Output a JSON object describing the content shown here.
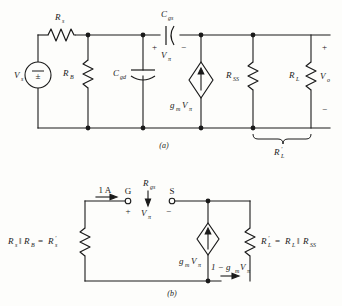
{
  "figure": {
    "caption_a": "(a)",
    "caption_b": "(b)"
  },
  "circuit_a": {
    "source_label": "V",
    "source_sub": "s",
    "source_symbol": "±",
    "rs_label": "R",
    "rs_sub": "s",
    "rb_label": "R",
    "rb_sub": "B",
    "cgd_label": "C",
    "cgd_sub": "gd",
    "cgs_label": "C",
    "cgs_sub": "gs",
    "vpi_label": "V",
    "vpi_sub": "π",
    "vpi_plus": "+",
    "vpi_minus": "−",
    "dep_source_gm": "g",
    "dep_source_gm_sub": "m",
    "dep_source_v": "V",
    "dep_source_v_sub": "π",
    "rss_label": "R",
    "rss_sub": "SS",
    "rl_label": "R",
    "rl_sub": "L",
    "vo_label": "V",
    "vo_sub": "o",
    "vo_plus": "+",
    "vo_minus": "−",
    "brace_label": "R",
    "brace_prime": "′",
    "brace_sub": "L"
  },
  "circuit_b": {
    "current_value": "1 A",
    "terminal_g": "G",
    "terminal_s": "S",
    "rgs_label": "R",
    "rgs_sub": "gs",
    "vpi_label": "V",
    "vpi_sub": "π",
    "vpi_plus": "+",
    "vpi_minus": "−",
    "left_res_expr": "R",
    "left_res_sub1": "s",
    "left_res_par": "‖",
    "left_res_expr2": "R",
    "left_res_sub2": "B",
    "left_res_eq": "=",
    "left_res_result": "R",
    "left_res_result_prime": "′",
    "left_res_result_sub": "s",
    "dep_source_gm": "g",
    "dep_source_gm_sub": "m",
    "dep_source_v": "V",
    "dep_source_v_sub": "π",
    "branch_current": "1 − g",
    "branch_current_sub": "m",
    "branch_current_v": "V",
    "branch_current_v_sub": "π",
    "rlp_label": "R",
    "rlp_prime": "′",
    "rlp_sub": "L",
    "rlp_eq": "=",
    "rlp_rl": "R",
    "rlp_rl_sub": "L",
    "rlp_par": "‖",
    "rlp_rss": "R",
    "rlp_rss_sub": "SS"
  }
}
